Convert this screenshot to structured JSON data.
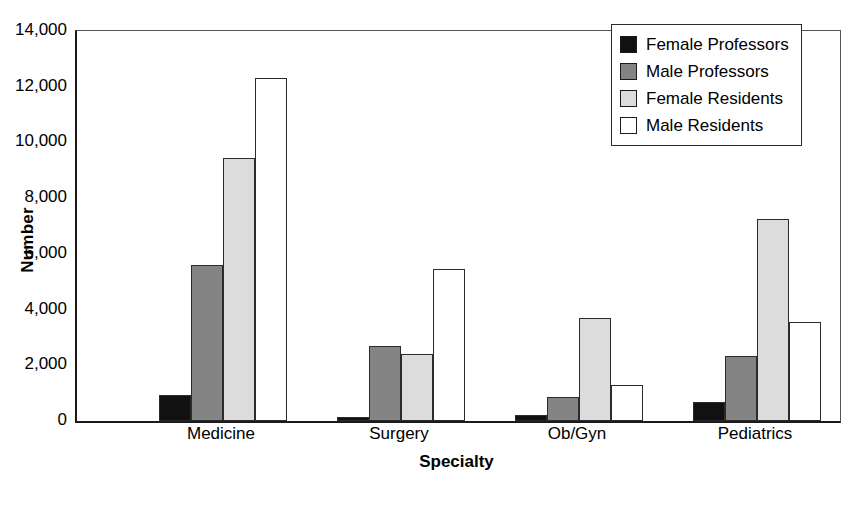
{
  "chart_data": {
    "type": "bar",
    "title": "",
    "subtitle": "",
    "xlabel": "Specialty",
    "ylabel": "Number",
    "categories": [
      "Medicine",
      "Surgery",
      "Ob/Gyn",
      "Pediatrics"
    ],
    "series": [
      {
        "name": "Female Professors",
        "color": "#111111",
        "values": [
          950,
          150,
          200,
          700
        ]
      },
      {
        "name": "Male Professors",
        "color": "#848484",
        "values": [
          5600,
          2700,
          850,
          2350
        ]
      },
      {
        "name": "Female Residents",
        "color": "#dcdcdc",
        "values": [
          9450,
          2400,
          3700,
          7250
        ]
      },
      {
        "name": "Male Residents",
        "color": "#ffffff",
        "values": [
          12300,
          5450,
          1300,
          3550
        ]
      }
    ],
    "ylim": [
      0,
      14000
    ],
    "ytick_values": [
      0,
      2000,
      4000,
      6000,
      8000,
      10000,
      12000,
      14000
    ],
    "ytick_labels": [
      "0",
      "2,000",
      "4,000",
      "6,000",
      "8,000",
      "10,000",
      "12,000",
      "14,000"
    ],
    "grid": false,
    "legend_position": "top-right",
    "bar_edge_color": "#2b2b2b",
    "axis_color": "#1a1a1a"
  },
  "legend": {
    "entries": [
      {
        "label": "Female Professors"
      },
      {
        "label": "Male Professors"
      },
      {
        "label": "Female Residents"
      },
      {
        "label": "Male Residents"
      }
    ]
  }
}
